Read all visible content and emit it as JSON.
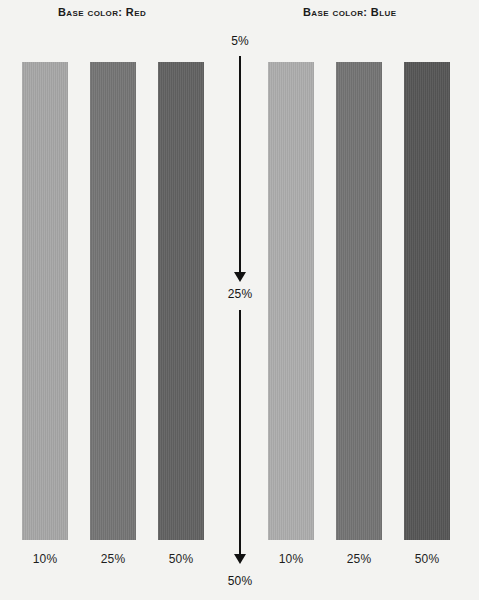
{
  "figure": {
    "background_color": "#f3f3f1",
    "groups": [
      {
        "heading": "Base color: Red",
        "swatches": [
          {
            "label": "10%",
            "color": "#a7a7a7"
          },
          {
            "label": "25%",
            "color": "#757575"
          },
          {
            "label": "50%",
            "color": "#626262"
          }
        ]
      },
      {
        "heading": "Base color: Blue",
        "swatches": [
          {
            "label": "10%",
            "color": "#adadad"
          },
          {
            "label": "25%",
            "color": "#747474"
          },
          {
            "label": "50%",
            "color": "#565656"
          }
        ]
      }
    ],
    "scale": {
      "top_label": "5%",
      "middle_label": "25%",
      "bottom_label": "50%",
      "line_color": "#111111"
    }
  },
  "chart_data": {
    "type": "bar",
    "xlabel": "",
    "ylabel": "",
    "categories": [
      "10%",
      "25%",
      "50%"
    ],
    "series": [
      {
        "name": "Base color: Red",
        "values": [
          10,
          25,
          50
        ]
      },
      {
        "name": "Base color: Blue",
        "values": [
          10,
          25,
          50
        ]
      }
    ],
    "annotations": [
      "5%",
      "25%",
      "50%"
    ],
    "legend": "none",
    "grid": false
  }
}
